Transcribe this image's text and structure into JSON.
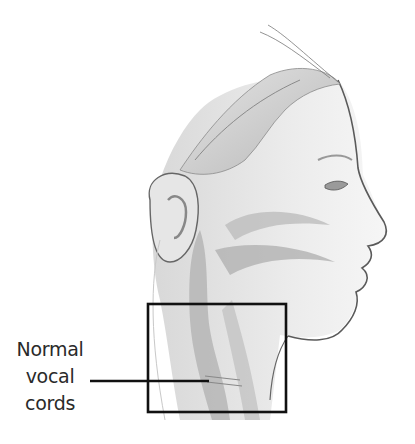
{
  "figure": {
    "callout": {
      "lines": [
        "Normal",
        "vocal",
        "cords"
      ],
      "target": "larynx region"
    },
    "highlight_box": {
      "x": 147,
      "y": 303,
      "width": 140,
      "height": 110,
      "stroke": "#111111"
    },
    "colors": {
      "outline": "#555555",
      "shade": "#d0d0d0",
      "dark_shade": "#a8a8a8",
      "background": "#ffffff"
    }
  }
}
